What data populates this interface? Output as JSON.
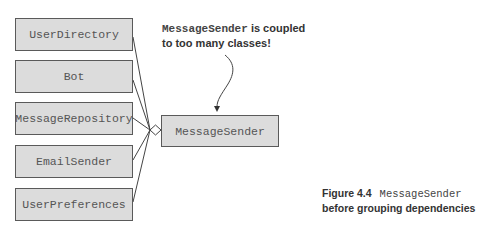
{
  "diagram": {
    "dependencies": [
      {
        "id": "user-directory",
        "label": "UserDirectory"
      },
      {
        "id": "bot",
        "label": "Bot"
      },
      {
        "id": "message-repository",
        "label": "MessageRepository"
      },
      {
        "id": "email-sender",
        "label": "EmailSender"
      },
      {
        "id": "user-preferences",
        "label": "UserPreferences"
      }
    ],
    "central_class": {
      "label": "MessageSender"
    },
    "connector": "aggregation-diamond",
    "annotation": {
      "code_term": "MessageSender",
      "text_line1": " is coupled",
      "text_line2": "to too many classes!"
    },
    "colors": {
      "box_fill": "#dcdcdc",
      "box_border": "#5a5a5a",
      "line": "#444444"
    }
  },
  "caption": {
    "figure_label": "Figure 4.4",
    "code_term": "MessageSender",
    "text": "before grouping dependencies"
  }
}
